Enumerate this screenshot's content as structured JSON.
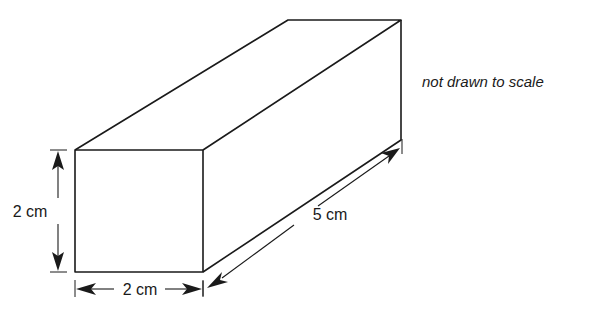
{
  "figure": {
    "shape": "rectangular prism",
    "note": "not drawn to scale",
    "dimensions": {
      "height": {
        "value": 2,
        "unit": "cm",
        "label": "2 cm"
      },
      "width": {
        "value": 2,
        "unit": "cm",
        "label": "2 cm"
      },
      "length": {
        "value": 5,
        "unit": "cm",
        "label": "5 cm"
      }
    },
    "colors": {
      "stroke": "#1a1a1a",
      "background": "#ffffff"
    }
  }
}
